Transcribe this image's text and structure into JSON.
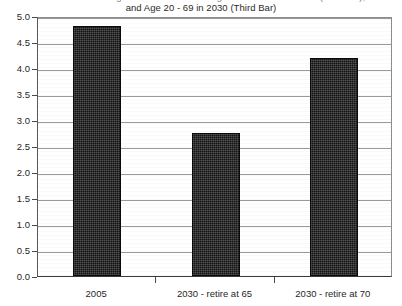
{
  "chart_data": {
    "type": "bar",
    "title": "Ratio of Persons Age 20 - 64 to Persons Age 65 and Over in 2005 (First Bar), and Age 20 - 69 in 2030 (Third Bar)",
    "title_lines": [
      "Ratio of Persons Age 20 - 64 to Persons Age 65 and Over in 2005 (First Bar),",
      "and Age 20 - 69 in 2030 (Third Bar)"
    ],
    "categories": [
      "2005",
      "2030 - retire at 65",
      "2030 - retire at 70"
    ],
    "values": [
      4.8,
      2.75,
      4.2
    ],
    "xlabel": "",
    "ylabel": "",
    "ylim": [
      0.0,
      5.0
    ],
    "ytick_labels": [
      "5.0",
      "4.5",
      "4.0",
      "3.5",
      "3.0",
      "2.5",
      "2.0",
      "1.5",
      "1.0",
      "0.5",
      "0.0"
    ],
    "ytick_values": [
      5.0,
      4.5,
      4.0,
      3.5,
      3.0,
      2.5,
      2.0,
      1.5,
      1.0,
      0.5,
      0.0
    ],
    "grid": true,
    "legend": false,
    "legend_position": "none",
    "bar_color": "#141414",
    "grid_color": "#9a9a9c",
    "axis_color": "#3a3a3c",
    "background_color": "#ffffff"
  }
}
